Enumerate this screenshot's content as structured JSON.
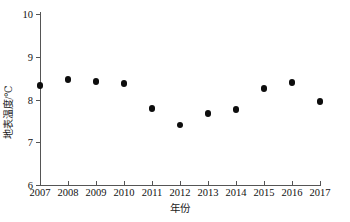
{
  "chart_data": {
    "type": "scatter",
    "title": "",
    "xlabel": "年份",
    "ylabel": "地表温度/℃",
    "categories": [
      "2007",
      "2008",
      "2009",
      "2010",
      "2011",
      "2012",
      "2013",
      "2014",
      "2015",
      "2016",
      "2017"
    ],
    "x": [
      2007,
      2008,
      2009,
      2010,
      2011,
      2012,
      2013,
      2014,
      2015,
      2016,
      2017
    ],
    "values": [
      8.33,
      8.47,
      8.42,
      8.37,
      7.79,
      7.41,
      7.67,
      7.77,
      8.26,
      8.4,
      7.95
    ],
    "series": [
      {
        "name": "地表温度",
        "values": [
          8.33,
          8.47,
          8.42,
          8.37,
          7.79,
          7.41,
          7.67,
          7.77,
          8.26,
          8.4,
          7.95
        ]
      }
    ],
    "xlim": [
      2007,
      2017
    ],
    "ylim": [
      6,
      10
    ],
    "yticks": [
      6,
      7,
      8,
      9,
      10
    ],
    "ytick_labels": [
      "6",
      "7",
      "8",
      "9",
      "10"
    ],
    "xticks": [
      2007,
      2008,
      2009,
      2010,
      2011,
      2012,
      2013,
      2014,
      2015,
      2016,
      2017
    ],
    "xtick_labels": [
      "2007",
      "2008",
      "2009",
      "2010",
      "2011",
      "2012",
      "2013",
      "2014",
      "2015",
      "2016",
      "2017"
    ],
    "grid": false,
    "legend": null,
    "marker": "circle",
    "marker_color": "#0d0d0d",
    "axis_color": "#555555"
  }
}
